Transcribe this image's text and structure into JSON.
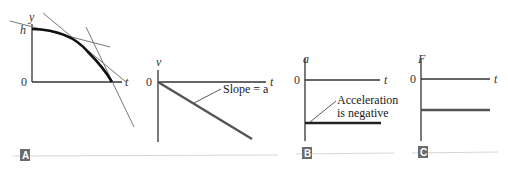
{
  "panels": {
    "A": {
      "tag": "A",
      "position_graph": {
        "y_axis_label": "y",
        "x_axis_label": "t",
        "origin_label": "0",
        "height_label": "h",
        "description": "Position vs time: concave-down curve starting at height h and falling to 0, with two tangent lines"
      },
      "velocity_graph": {
        "y_axis_label": "v",
        "x_axis_label": "t",
        "origin_label": "0",
        "annotation": "Slope = a",
        "description": "Velocity vs time: straight line starting at 0 with negative slope"
      }
    },
    "B": {
      "tag": "B",
      "y_axis_label": "a",
      "x_axis_label": "t",
      "origin_label": "0",
      "annotation_line1": "Acceleration",
      "annotation_line2": "is negative",
      "description": "Acceleration vs time: constant negative value"
    },
    "C": {
      "tag": "C",
      "y_axis_label": "F",
      "x_axis_label": "t",
      "origin_label": "0",
      "description": "Force vs time: constant negative value"
    }
  },
  "colors": {
    "axis": "#333333",
    "curve": "#111111",
    "tangent": "#777777",
    "data_line": "#555555",
    "tag_bg": "#6b6b6b",
    "rule": "#cccccc"
  }
}
